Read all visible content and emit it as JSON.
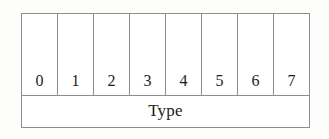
{
  "figure": {
    "kind": "bit-field-diagram",
    "background_color": "#fdfdfb",
    "border_color": "#8d8d8d",
    "text_color": "#1d1d1d"
  },
  "bit_row": {
    "bits": [
      {
        "label": "0"
      },
      {
        "label": "1"
      },
      {
        "label": "2"
      },
      {
        "label": "3"
      },
      {
        "label": "4"
      },
      {
        "label": "5"
      },
      {
        "label": "6"
      },
      {
        "label": "7"
      }
    ]
  },
  "name_row": {
    "label": "Type"
  }
}
